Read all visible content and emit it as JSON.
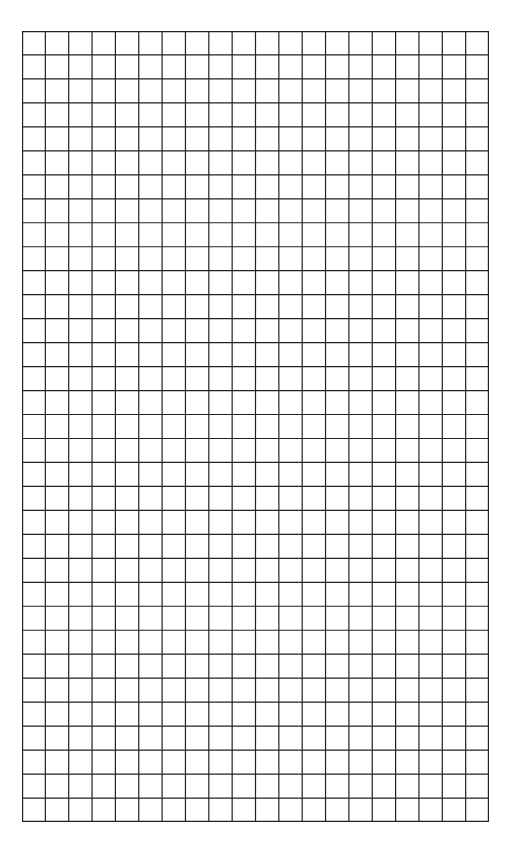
{
  "document": {
    "type": "graph-paper",
    "background_color": "#ffffff",
    "line_color": "#222222"
  },
  "grid": {
    "columns": 20,
    "rows": 33,
    "left": 22,
    "top": 31,
    "width": 467,
    "height": 791,
    "line_width": 1.2
  }
}
